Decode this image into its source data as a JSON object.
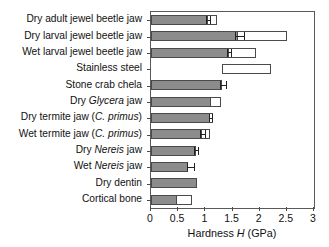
{
  "chart_data": {
    "type": "bar",
    "orientation": "horizontal",
    "title": "",
    "xlabel_parts": {
      "pre": "Hardness ",
      "italic": "H",
      "post": " (GPa)"
    },
    "xlabel": "Hardness H (GPa)",
    "ylabel": "",
    "xlim": [
      0,
      3
    ],
    "xticks": [
      0,
      0.5,
      1,
      1.5,
      2,
      2.5,
      3
    ],
    "xticklabels": [
      "0",
      "0.5",
      "1",
      "1.5",
      "2",
      "2.5",
      "3"
    ],
    "grid": false,
    "legend": null,
    "series_note": "Filled grey bar = mean hardness; open white extension = upper range; floating open bar = range only; whiskers = error bars",
    "categories": [
      "Dry adult jewel beetle jaw",
      "Dry larval jewel beetle jaw",
      "Wet larval jewel beetle jaw",
      "Stainless steel",
      "Stone crab chela",
      "Dry Glycera jaw",
      "Dry termite jaw (C. primus)",
      "Wet termite jaw (C. primus)",
      "Dry Nereis jaw",
      "Wet Nereis jaw",
      "Dry dentin",
      "Cortical bone"
    ],
    "bars": [
      {
        "label_parts": [
          {
            "t": "Dry adult jewel beetle jaw",
            "i": false
          }
        ],
        "filled_start": 0,
        "filled_end": 1.05,
        "open_start": 1.05,
        "open_end": 1.22,
        "err_center": 1.05,
        "err_low": 1.01,
        "err_high": 1.09
      },
      {
        "label_parts": [
          {
            "t": "Dry larval jewel beetle jaw",
            "i": false
          }
        ],
        "filled_start": 0,
        "filled_end": 1.6,
        "open_start": 1.6,
        "open_end": 2.5,
        "err_center": 1.62,
        "err_low": 1.55,
        "err_high": 1.72
      },
      {
        "label_parts": [
          {
            "t": "Wet larval jewel beetle jaw",
            "i": false
          }
        ],
        "filled_start": 0,
        "filled_end": 1.44,
        "open_start": 1.44,
        "open_end": 1.93,
        "err_center": 1.44,
        "err_low": 1.4,
        "err_high": 1.48
      },
      {
        "label_parts": [
          {
            "t": "Stainless steel",
            "i": false
          }
        ],
        "filled_start": null,
        "filled_end": null,
        "open_start": 1.3,
        "open_end": 2.2,
        "err_center": null,
        "err_low": null,
        "err_high": null
      },
      {
        "label_parts": [
          {
            "t": "Stone crab chela",
            "i": false
          }
        ],
        "filled_start": 0,
        "filled_end": 1.31,
        "open_start": null,
        "open_end": null,
        "err_center": 1.31,
        "err_low": 1.27,
        "err_high": 1.38
      },
      {
        "label_parts": [
          {
            "t": "Dry ",
            "i": false
          },
          {
            "t": "Glycera",
            "i": true
          },
          {
            "t": " jaw",
            "i": false
          }
        ],
        "filled_start": 0,
        "filled_end": 1.1,
        "open_start": 1.1,
        "open_end": 1.29,
        "err_center": null,
        "err_low": null,
        "err_high": null
      },
      {
        "label_parts": [
          {
            "t": "Dry termite jaw (",
            "i": false
          },
          {
            "t": "C. primus",
            "i": true
          },
          {
            "t": ")",
            "i": false
          }
        ],
        "filled_start": 0,
        "filled_end": 1.09,
        "open_start": 1.09,
        "open_end": 1.15,
        "err_center": 1.09,
        "err_low": 1.06,
        "err_high": 1.13
      },
      {
        "label_parts": [
          {
            "t": "Wet termite jaw (",
            "i": false
          },
          {
            "t": "C. primus",
            "i": true
          },
          {
            "t": ")",
            "i": false
          }
        ],
        "filled_start": 0,
        "filled_end": 0.94,
        "open_start": 0.94,
        "open_end": 1.09,
        "err_center": 0.95,
        "err_low": 0.9,
        "err_high": 1.0
      },
      {
        "label_parts": [
          {
            "t": "Dry ",
            "i": false
          },
          {
            "t": "Nereis",
            "i": true
          },
          {
            "t": " jaw",
            "i": false
          }
        ],
        "filled_start": 0,
        "filled_end": 0.83,
        "open_start": null,
        "open_end": null,
        "err_center": 0.83,
        "err_low": 0.8,
        "err_high": 0.86
      },
      {
        "label_parts": [
          {
            "t": "Wet ",
            "i": false
          },
          {
            "t": "Nereis",
            "i": true
          },
          {
            "t": " jaw",
            "i": false
          }
        ],
        "filled_start": 0,
        "filled_end": 0.68,
        "open_start": null,
        "open_end": null,
        "err_center": 0.68,
        "err_low": 0.66,
        "err_high": 0.79
      },
      {
        "label_parts": [
          {
            "t": "Dry dentin",
            "i": false
          }
        ],
        "filled_start": 0,
        "filled_end": 0.85,
        "open_start": null,
        "open_end": null,
        "err_center": null,
        "err_low": null,
        "err_high": null
      },
      {
        "label_parts": [
          {
            "t": "Cortical bone",
            "i": false
          }
        ],
        "filled_start": 0,
        "filled_end": 0.48,
        "open_start": 0.48,
        "open_end": 0.75,
        "err_center": null,
        "err_low": null,
        "err_high": null
      }
    ],
    "colors": {
      "bar_fill": "#8c8c8c",
      "bar_open": "#ffffff",
      "bar_edge": "#4a4a4a",
      "axis": "#5a5a5a",
      "text": "#111111",
      "error": "#222222",
      "background": "#ffffff"
    }
  }
}
